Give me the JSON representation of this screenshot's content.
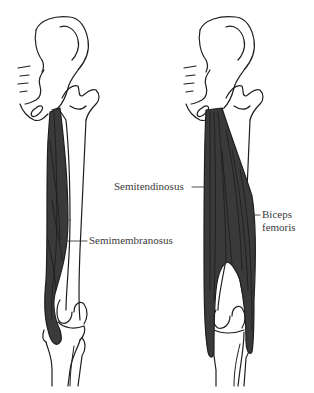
{
  "diagram": {
    "type": "anatomical-illustration",
    "colors": {
      "muscle": "#3a3a3a",
      "muscle_striations": "#1a1a1a",
      "bone_outline": "#1e1e1e",
      "label_text": "#3a3a3a",
      "background": "#ffffff"
    },
    "panels": [
      {
        "id": "left",
        "labels": [
          {
            "text": "Semimembranosus"
          }
        ]
      },
      {
        "id": "right",
        "labels": [
          {
            "text": "Semitendinosus"
          },
          {
            "text_line1": "Biceps",
            "text_line2": "femoris"
          }
        ]
      }
    ]
  }
}
